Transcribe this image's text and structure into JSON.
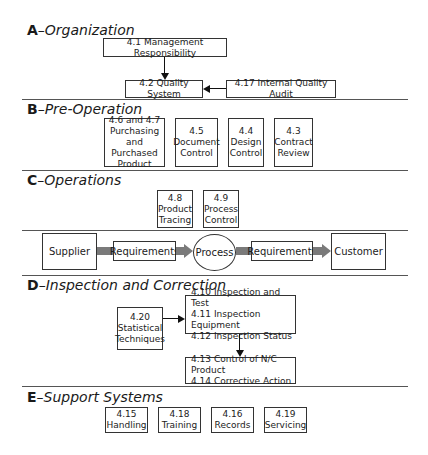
{
  "sections": {
    "A": {
      "letter": "A",
      "name": "–Organization",
      "boxes": {
        "mgmt": "4.1 Management Responsibility",
        "quality_system": "4.2 Quality System",
        "internal_audit": "4.17 Internal Quality Audit"
      }
    },
    "B": {
      "letter": "B",
      "name": "–Pre-Operation",
      "boxes": [
        {
          "lines": [
            "4.6 and 4.7",
            "Purchasing",
            "and Purchased",
            "Product"
          ]
        },
        {
          "lines": [
            "4.5",
            "Document",
            "Control"
          ]
        },
        {
          "lines": [
            "4.4",
            "Design",
            "Control"
          ]
        },
        {
          "lines": [
            "4.3",
            "Contract",
            "Review"
          ]
        }
      ]
    },
    "C": {
      "letter": "C",
      "name": "–Operations",
      "boxes": [
        {
          "lines": [
            "4.8",
            "Product",
            "Tracing"
          ]
        },
        {
          "lines": [
            "4.9",
            "Process",
            "Control"
          ]
        }
      ],
      "flow": {
        "supplier": "Supplier",
        "requirements_in": "Requirements",
        "process": "Process",
        "requirements_out": "Requirements",
        "customer": "Customer"
      }
    },
    "D": {
      "letter": "D",
      "name": "–Inspection and Correction",
      "statistical": {
        "lines": [
          "4.20",
          "Statistical",
          "Techniques"
        ]
      },
      "inspection": {
        "lines": [
          "4.10 Inspection and Test",
          "4.11 Inspection Equipment",
          "4.12 Inspection Status"
        ]
      },
      "correction": {
        "lines": [
          "4.13 Control of N/C Product",
          "4.14 Corrective Action"
        ]
      }
    },
    "E": {
      "letter": "E",
      "name": "–Support Systems",
      "boxes": [
        {
          "lines": [
            "4.15",
            "Handling"
          ]
        },
        {
          "lines": [
            "4.18",
            "Training"
          ]
        },
        {
          "lines": [
            "4.16",
            "Records"
          ]
        },
        {
          "lines": [
            "4.19",
            "Servicing"
          ]
        }
      ]
    }
  },
  "colors": {
    "line": "#111111",
    "flow_arrow": "#7a7a7a",
    "divider": "#555555"
  }
}
